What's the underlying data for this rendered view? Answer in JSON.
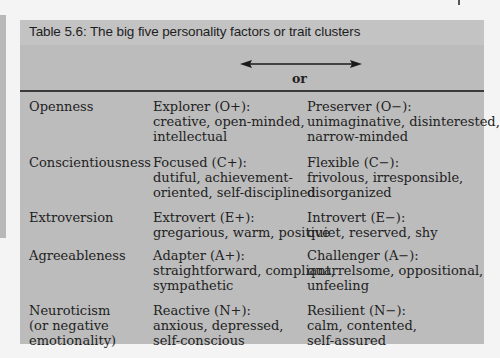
{
  "table": {
    "title": "Table 5.6: The big five personality factors or trait clusters",
    "header": {
      "connector": "or",
      "arrow_icon": "double-headed-arrow"
    },
    "rows": [
      {
        "factor": [
          "Openness"
        ],
        "positive": [
          "Explorer (O+):",
          "creative, open-minded,",
          "intellectual"
        ],
        "negative": [
          "Preserver (O−):",
          "unimaginative, disinterested,",
          "narrow-minded"
        ]
      },
      {
        "factor": [
          "Conscientiousness"
        ],
        "positive": [
          "Focused (C+):",
          "dutiful, achievement-",
          "oriented, self-disciplined"
        ],
        "negative": [
          "Flexible (C−):",
          "frivolous, irresponsible,",
          "disorganized"
        ]
      },
      {
        "factor": [
          "Extroversion"
        ],
        "positive": [
          "Extrovert (E+):",
          "gregarious, warm, positive"
        ],
        "negative": [
          "Introvert (E−):",
          "quiet, reserved, shy"
        ]
      },
      {
        "factor": [
          "Agreeableness"
        ],
        "positive": [
          "Adapter (A+):",
          "straightforward, compliant,",
          "sympathetic"
        ],
        "negative": [
          "Challenger (A−):",
          "quarrelsome, oppositional,",
          "unfeeling"
        ]
      },
      {
        "factor": [
          "Neuroticism",
          "(or negative",
          "emotionality)"
        ],
        "positive": [
          "Reactive (N+):",
          "anxious, depressed,",
          "self-conscious"
        ],
        "negative": [
          "Resilient (N−):",
          "calm, contented,",
          "self-assured"
        ]
      }
    ]
  }
}
